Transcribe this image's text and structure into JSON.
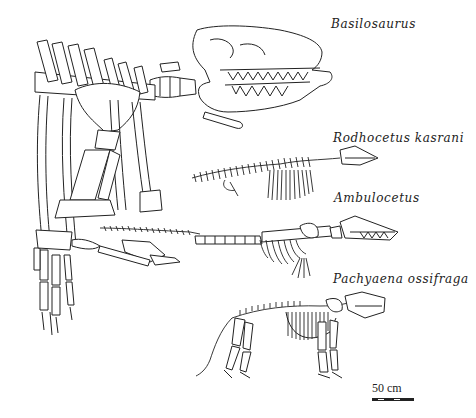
{
  "figure": {
    "labels": {
      "basilosaurus": "Basilosaurus",
      "rodhocetus": "Rodhocetus  kasrani",
      "ambulocetus": "Ambulocetus",
      "pachyaena": "Pachyaena  ossifraga"
    },
    "scale_bar": {
      "label": "50 cm"
    },
    "skeletons": [
      {
        "name": "Basilosaurus",
        "position": "top-left large",
        "facing": "right"
      },
      {
        "name": "Rodhocetus kasrani",
        "position": "upper-middle",
        "facing": "right"
      },
      {
        "name": "Ambulocetus",
        "position": "middle",
        "facing": "right"
      },
      {
        "name": "Pachyaena ossifraga",
        "position": "bottom",
        "facing": "right"
      }
    ]
  }
}
